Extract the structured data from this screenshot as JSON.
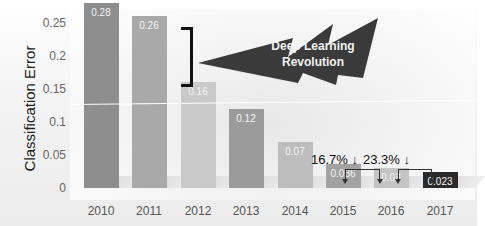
{
  "chart_data": {
    "type": "bar",
    "title": "",
    "xlabel": "",
    "ylabel": "Classification Error",
    "ylim": [
      0,
      0.28
    ],
    "yticks": [
      "0",
      "0.05",
      "0.1",
      "0.15",
      "0.2",
      "0.25"
    ],
    "categories": [
      "2010",
      "2011",
      "2012",
      "2013",
      "2014",
      "2015",
      "2016",
      "2017"
    ],
    "values": [
      0.28,
      0.26,
      0.16,
      0.12,
      0.07,
      0.036,
      0.03,
      0.023
    ],
    "value_labels": [
      "0.28",
      "0.26",
      "0.16",
      "0.12",
      "0.07",
      "0.036",
      "0.03",
      "0.023"
    ],
    "bar_colors": [
      "#8e8e8e",
      "#a9a9a9",
      "#c9c9c9",
      "#9b9b9b",
      "#bdbdbd",
      "#a2a2a2",
      "#c4c4c4",
      "#2b2b2b"
    ],
    "grid": false,
    "legend": "none",
    "annotations": [
      {
        "text": "Deep Learning Revolution",
        "type": "lightning-bolt",
        "targets": [
          "2010",
          "2011"
        ]
      },
      {
        "text": "16.7% ↓",
        "from": "2015",
        "to": "2016"
      },
      {
        "text": "23.3% ↓",
        "from": "2016",
        "to": "2017"
      }
    ]
  },
  "labels": {
    "ylabel": "Classification Error",
    "bolt_line1": "Deep Learning",
    "bolt_line2": "Revolution",
    "pct1": "16.7% ↓",
    "pct2": "23.3% ↓"
  }
}
